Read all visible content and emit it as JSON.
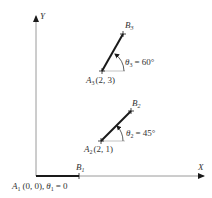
{
  "axes": {
    "x_label": "Y",
    "x_axis_label": "X",
    "y_axis_label": "Y"
  },
  "points": [
    {
      "a": "A",
      "a_sub": "1",
      "coords": "(0, 0),",
      "theta": "θ",
      "theta_sub": "1",
      "theta_val": "= 0",
      "b": "B",
      "b_sub": "1"
    },
    {
      "a": "A",
      "a_sub": "2",
      "coords": "(2, 1)",
      "theta": "θ",
      "theta_sub": "2",
      "theta_val": "= 45°",
      "b": "B",
      "b_sub": "2"
    },
    {
      "a": "A",
      "a_sub": "3",
      "coords": "(2, 3)",
      "theta": "θ",
      "theta_sub": "3",
      "theta_val": "= 60°",
      "b": "B",
      "b_sub": "3"
    }
  ],
  "colors": {
    "axis": "#9a9a9a",
    "segment": "#1a1a1a",
    "ref": "#aaaaaa",
    "text": "#333333"
  }
}
